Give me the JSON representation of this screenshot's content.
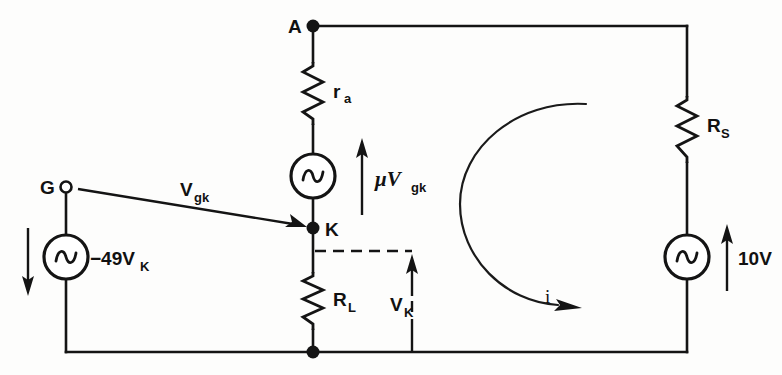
{
  "figure": {
    "kind": "electrical-circuit-schematic",
    "background_color": "#fdfdfc",
    "ink_color": "#141414",
    "width": 782,
    "height": 375
  },
  "nodes": {
    "anode": {
      "label": "A",
      "type": "filled-terminal"
    },
    "cathode": {
      "label": "K",
      "type": "filled-terminal"
    },
    "grid": {
      "label": "G",
      "type": "open-terminal"
    },
    "ground_junction": {
      "label": "",
      "type": "filled-junction"
    }
  },
  "components": {
    "plate_resistance": {
      "label": "r",
      "subscript": "a",
      "type": "resistor"
    },
    "load_resistance": {
      "label": "R",
      "subscript": "L",
      "type": "resistor"
    },
    "source_resistance": {
      "label": "R",
      "subscript": "S",
      "type": "resistor"
    },
    "dependent_source": {
      "label": "",
      "type": "ac-source",
      "arrow_label": "μV",
      "arrow_subscript": "gk"
    },
    "grid_source": {
      "label": "−49V",
      "subscript": "K",
      "type": "ac-source"
    },
    "signal_source": {
      "label": "10V",
      "subscript": "",
      "type": "ac-source"
    }
  },
  "annotations": {
    "vgk": {
      "text": "V",
      "subscript": "gk",
      "desc": "grid-to-cathode voltage arrow from G to K"
    },
    "muvgk": {
      "text": "μV",
      "subscript": "gk",
      "desc": "amplified source voltage arrow"
    },
    "vk": {
      "text": "V",
      "subscript": "K",
      "desc": "cathode voltage arrow across R_L"
    },
    "loop_current": {
      "text": "i",
      "desc": "mesh current loop, clockwise"
    },
    "grid_arrow": {
      "text": "",
      "desc": "downward reference arrow beside -49V_K source"
    },
    "tenv_arrow": {
      "text": "10V",
      "desc": "upward reference arrow beside signal source"
    }
  }
}
